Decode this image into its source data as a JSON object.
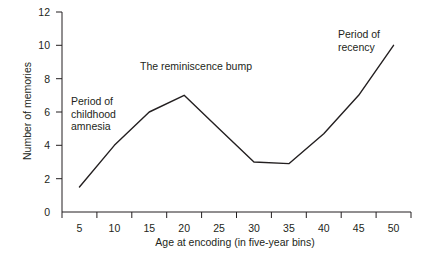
{
  "chart_data": {
    "type": "line",
    "title": "",
    "xlabel": "Age at encoding (in five-year bins)",
    "ylabel": "Number of memories",
    "x": [
      5,
      10,
      15,
      20,
      25,
      30,
      35,
      40,
      45,
      50
    ],
    "values": [
      1.5,
      4,
      6,
      7,
      5,
      3,
      2.9,
      4.7,
      7,
      10
    ],
    "series": [
      {
        "name": "Number of memories",
        "values": [
          1.5,
          4,
          6,
          7,
          5,
          3,
          2.9,
          4.7,
          7,
          10
        ]
      }
    ],
    "xticks": [
      "5",
      "10",
      "15",
      "20",
      "25",
      "30",
      "35",
      "40",
      "45",
      "50"
    ],
    "yticks": [
      "0",
      "2",
      "4",
      "6",
      "8",
      "10",
      "12"
    ],
    "xlim": [
      2.5,
      52.5
    ],
    "ylim": [
      0,
      12
    ],
    "grid": false,
    "legend": "none",
    "line_color": "#231f20",
    "axis_color": "#231f20",
    "background_color": "#ffffff",
    "annotations": [
      {
        "name": "childhood-amnesia",
        "text": "Period of\nchildhood\namnesia",
        "x": 7.5,
        "y": 7.0
      },
      {
        "name": "reminiscence-bump",
        "text": "The reminiscence bump",
        "x": 15,
        "y": 9.1
      },
      {
        "name": "recency",
        "text": "Period of\nrecency",
        "x": 45,
        "y": 11.0
      }
    ]
  },
  "axes": {
    "y_title": "Number of memories",
    "x_title": "Age at encoding (in five-year bins)",
    "y_tick_labels": [
      "12",
      "10",
      "8",
      "6",
      "4",
      "2",
      "0"
    ],
    "x_tick_labels": [
      "5",
      "10",
      "15",
      "20",
      "25",
      "30",
      "35",
      "40",
      "45",
      "50"
    ]
  },
  "annotations": {
    "childhood_amnesia": "Period of\nchildhood\namnesia",
    "reminiscence_bump": "The reminiscence bump",
    "recency": "Period of\nrecency"
  }
}
